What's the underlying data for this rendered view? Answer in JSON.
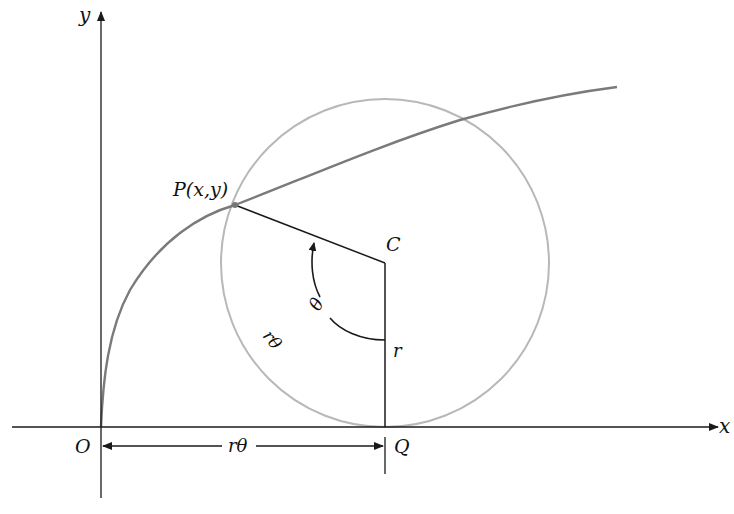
{
  "figure": {
    "colors": {
      "axes": "#1a1a1a",
      "curve": "#7a7a7a",
      "circle": "#b5b5b5",
      "segments": "#1a1a1a",
      "background": "#ffffff"
    },
    "axes": {
      "x_label": "x",
      "y_label": "y",
      "origin_label": "O"
    },
    "points": {
      "P": {
        "label": "P(x,y)"
      },
      "C": {
        "label": "C"
      },
      "Q": {
        "label": "Q"
      }
    },
    "labels": {
      "radius": "r",
      "angle": "θ",
      "arc_length": "rθ",
      "base_length": "rθ"
    }
  }
}
